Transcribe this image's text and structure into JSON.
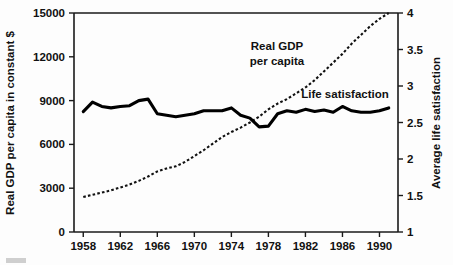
{
  "chart_data": {
    "type": "line",
    "title": "",
    "xlabel": "",
    "x_tick_labels": [
      "1958",
      "1962",
      "1966",
      "1970",
      "1974",
      "1978",
      "1982",
      "1986",
      "1990"
    ],
    "x_ticks": [
      1958,
      1962,
      1966,
      1970,
      1974,
      1978,
      1982,
      1986,
      1990
    ],
    "xlim": [
      1957,
      1992
    ],
    "grid": false,
    "legend_position": "inline-annotations",
    "left_axis": {
      "label": "Real GDP per capita in constant $",
      "ylim": [
        0,
        15000
      ],
      "ticks": [
        0,
        3000,
        6000,
        9000,
        12000,
        15000
      ],
      "tick_labels": [
        "0",
        "3000",
        "6000",
        "9000",
        "12000",
        "15000"
      ]
    },
    "right_axis": {
      "label": "Average life satisfaction",
      "ylim": [
        1,
        4
      ],
      "ticks": [
        1,
        1.5,
        2,
        2.5,
        3,
        3.5,
        4
      ],
      "tick_labels": [
        "1",
        "1.5",
        "2",
        "2.5",
        "3",
        "3.5",
        "4"
      ]
    },
    "series": [
      {
        "name": "Real GDP per capita",
        "style": "dotted",
        "axis": "left",
        "annotation": "Real GDP\nper capita",
        "annotation_line1": "Real GDP",
        "annotation_line2": "per capita",
        "x": [
          1958,
          1959,
          1960,
          1961,
          1962,
          1963,
          1964,
          1965,
          1966,
          1967,
          1968,
          1969,
          1970,
          1971,
          1972,
          1973,
          1974,
          1975,
          1976,
          1977,
          1978,
          1979,
          1980,
          1981,
          1982,
          1983,
          1984,
          1985,
          1986,
          1987,
          1988,
          1989,
          1990,
          1991
        ],
        "values": [
          2400,
          2550,
          2700,
          2850,
          3050,
          3250,
          3500,
          3800,
          4150,
          4350,
          4500,
          4800,
          5200,
          5600,
          6050,
          6500,
          6850,
          7150,
          7500,
          7900,
          8400,
          8800,
          9100,
          9500,
          9900,
          10400,
          11000,
          11600,
          12200,
          12900,
          13500,
          14100,
          14600,
          15000
        ]
      },
      {
        "name": "Life satisfaction",
        "style": "solid",
        "axis": "right",
        "annotation": "Life satisfaction",
        "x": [
          1958,
          1959,
          1960,
          1961,
          1962,
          1963,
          1964,
          1965,
          1966,
          1967,
          1968,
          1969,
          1970,
          1971,
          1972,
          1973,
          1974,
          1975,
          1976,
          1977,
          1978,
          1979,
          1980,
          1981,
          1982,
          1983,
          1984,
          1985,
          1986,
          1987,
          1988,
          1989,
          1990,
          1991
        ],
        "values": [
          2.65,
          2.78,
          2.72,
          2.7,
          2.72,
          2.73,
          2.8,
          2.82,
          2.62,
          2.6,
          2.58,
          2.6,
          2.62,
          2.66,
          2.66,
          2.66,
          2.7,
          2.6,
          2.56,
          2.44,
          2.45,
          2.62,
          2.66,
          2.64,
          2.68,
          2.65,
          2.67,
          2.64,
          2.72,
          2.66,
          2.64,
          2.64,
          2.66,
          2.7
        ]
      }
    ]
  },
  "annotations": {
    "gdp_line1": "Real GDP",
    "gdp_line2": "per capita",
    "life": "Life satisfaction"
  }
}
